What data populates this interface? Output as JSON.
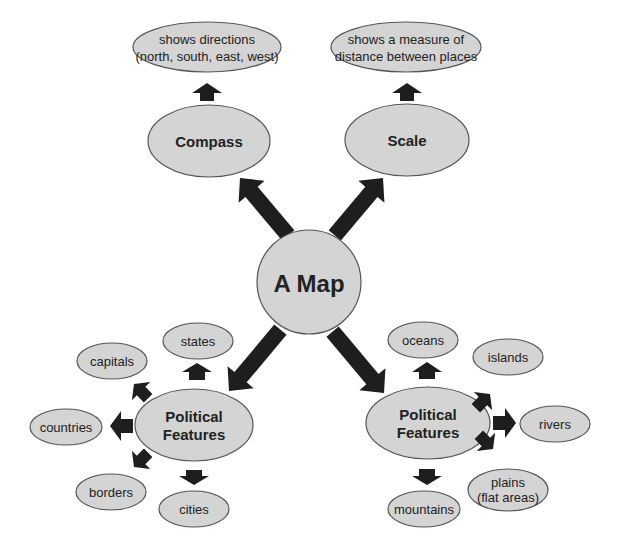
{
  "diagram": {
    "center": {
      "label": "A Map"
    },
    "branches": [
      {
        "id": "compass",
        "label": "Compass",
        "description": [
          "shows directions",
          "(north, south, east, west)"
        ]
      },
      {
        "id": "scale",
        "label": "Scale",
        "description": [
          "shows a measure of",
          "distance between places"
        ]
      },
      {
        "id": "political-left",
        "label": [
          "Political",
          "Features"
        ],
        "children": [
          "states",
          "capitals",
          "countries",
          "borders",
          "cities"
        ]
      },
      {
        "id": "political-right",
        "label": [
          "Political",
          "Features"
        ],
        "children": [
          "oceans",
          "islands",
          "rivers",
          [
            "plains",
            "(flat areas)"
          ],
          "mountains"
        ]
      }
    ]
  },
  "colors": {
    "node_fill": "#d4d4d4",
    "node_stroke": "#555555",
    "arrow": "#1e1e1e",
    "text": "#222222",
    "background": "#ffffff"
  }
}
